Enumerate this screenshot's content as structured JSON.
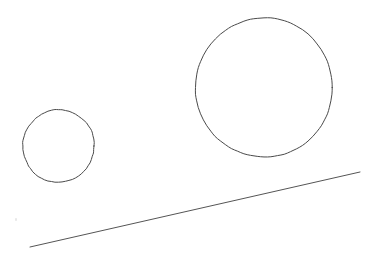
{
  "canvas": {
    "width": 375,
    "height": 262,
    "background_color": "#ffffff",
    "title": "hand-drawn geometric sketch"
  },
  "style": {
    "stroke_color": "#4a4a4a",
    "stroke_color_line": "#555555",
    "stroke_width": 1,
    "speck_color": "#e8e8e8"
  },
  "shapes": [
    {
      "id": "small-circle",
      "type": "circle",
      "label": "small circle",
      "cx": 58.5,
      "cy": 146,
      "r": 36,
      "stroke_color": "#4a4a4a",
      "stroke_width": 1
    },
    {
      "id": "large-circle",
      "type": "circle",
      "label": "large circle",
      "cx": 264,
      "cy": 87.5,
      "r": 69,
      "stroke_color": "#4a4a4a",
      "stroke_width": 1
    },
    {
      "id": "diagonal-line",
      "type": "line",
      "label": "diagonal line",
      "x1": 30,
      "y1": 247,
      "x2": 360,
      "y2": 172,
      "stroke_color": "#555555",
      "stroke_width": 1
    }
  ],
  "artifacts": [
    {
      "id": "speck-left",
      "label": "faint scan speck",
      "x": 15,
      "y": 218
    }
  ]
}
